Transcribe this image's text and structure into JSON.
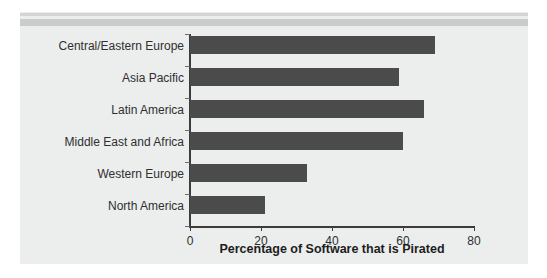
{
  "chart_data": {
    "type": "bar",
    "orientation": "horizontal",
    "title": "",
    "xlabel": "Percentage of Software that is Pirated",
    "ylabel": "",
    "categories": [
      "Central/Eastern Europe",
      "Asia Pacific",
      "Latin America",
      "Middle East and Africa",
      "Western Europe",
      "North America"
    ],
    "values": [
      69,
      59,
      66,
      60,
      33,
      21
    ],
    "xlim": [
      0,
      80
    ],
    "xticks": [
      0,
      20,
      40,
      60,
      80
    ],
    "xtick_labels": [
      "0",
      "20",
      "40",
      "60",
      "80"
    ],
    "grid": false,
    "legend": null,
    "bar_color": "#4b4b4b",
    "panel_background": "#eceded",
    "axis_color": "#3b3b3b",
    "text_color": "#2f2f2f"
  }
}
